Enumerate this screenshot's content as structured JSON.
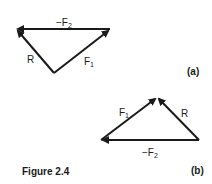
{
  "figure": {
    "caption": "Figure 2.4",
    "panels": [
      {
        "id": "a",
        "tag": "(a)",
        "vectors": [
          {
            "name": "-F2",
            "label_main": "−F",
            "label_sub": "2",
            "from": [
              110,
              29
            ],
            "to": [
              16,
              29
            ]
          },
          {
            "name": "R",
            "label_main": "R",
            "label_sub": "",
            "from": [
              54,
              73
            ],
            "to": [
              16,
              29
            ]
          },
          {
            "name": "F1",
            "label_main": "F",
            "label_sub": "1",
            "from": [
              54,
              73
            ],
            "to": [
              110,
              29
            ]
          }
        ]
      },
      {
        "id": "b",
        "tag": "(b)",
        "vectors": [
          {
            "name": "F1",
            "label_main": "F",
            "label_sub": "1",
            "from": [
              101,
              140
            ],
            "to": [
              157,
              97
            ]
          },
          {
            "name": "R",
            "label_main": "R",
            "label_sub": "",
            "from": [
              199,
              140
            ],
            "to": [
              157,
              97
            ]
          },
          {
            "name": "-F2",
            "label_main": "−F",
            "label_sub": "2",
            "from": [
              199,
              140
            ],
            "to": [
              101,
              140
            ]
          }
        ]
      }
    ]
  }
}
